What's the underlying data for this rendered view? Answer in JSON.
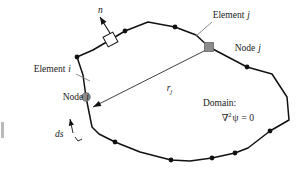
{
  "figure": {
    "background_color": "#ffffff",
    "line_color": "#111111",
    "node_i_color": "#8c8c8c",
    "node_j_color": "#8c8c8c",
    "leader_color": "#6f6f6f"
  },
  "labels": {
    "normal": "n",
    "element_i": "Element",
    "element_i_index": "i",
    "element_j": "Element",
    "element_j_index": "j",
    "node_i": "Node",
    "node_i_index": "i",
    "node_j": "Node",
    "node_j_index": "j",
    "ds": "ds",
    "r": "r",
    "r_index": "j",
    "domain": "Domain:",
    "laplacian_operator": "∇",
    "laplacian_power": "2",
    "laplacian_field": "ψ",
    "laplacian_equals": "= 0"
  },
  "geometry": {
    "boundary_points": [
      [
        93,
        50
      ],
      [
        110,
        40
      ],
      [
        125,
        31
      ],
      [
        148,
        22
      ],
      [
        175,
        27
      ],
      [
        196,
        35
      ],
      [
        209,
        47
      ],
      [
        247,
        67
      ],
      [
        272,
        74
      ],
      [
        287,
        97
      ],
      [
        289,
        120
      ],
      [
        270,
        131
      ],
      [
        248,
        148
      ],
      [
        235,
        153
      ],
      [
        212,
        158
      ],
      [
        190,
        161
      ],
      [
        171,
        160
      ],
      [
        140,
        152
      ],
      [
        115,
        142
      ],
      [
        99,
        134
      ],
      [
        92,
        127
      ],
      [
        86,
        97
      ],
      [
        83,
        75
      ],
      [
        77,
        57
      ],
      [
        93,
        50
      ]
    ],
    "boundary_node_dots": [
      [
        125,
        31
      ],
      [
        175,
        27
      ],
      [
        247,
        67
      ],
      [
        270,
        131
      ],
      [
        235,
        153
      ],
      [
        212,
        158
      ],
      [
        171,
        160
      ],
      [
        115,
        142
      ],
      [
        77,
        57
      ]
    ],
    "node_i": [
      86,
      97
    ],
    "node_j": [
      209,
      47
    ],
    "r_arrow_start": [
      206,
      50
    ],
    "r_arrow_end": [
      93,
      107
    ],
    "normal_arrow_start": [
      113,
      38
    ],
    "normal_arrow_end": [
      100,
      17
    ],
    "perp_box": [
      105,
      34
    ],
    "ds_arrow_start": [
      73,
      133
    ],
    "ds_arrow_end": [
      70,
      119
    ]
  },
  "label_positions": {
    "normal": [
      98,
      13
    ],
    "element_i": [
      17,
      72
    ],
    "element_i_leader": "M 76,74 L 90,81",
    "element_j": [
      196,
      18
    ],
    "element_j_leader": "M 212,22 L 196,36",
    "node_i": [
      46,
      100
    ],
    "node_j": [
      218,
      50
    ],
    "ds": [
      57,
      134
    ],
    "r": [
      152,
      90
    ],
    "domain": [
      203,
      105
    ],
    "laplacian": [
      205,
      120
    ]
  }
}
